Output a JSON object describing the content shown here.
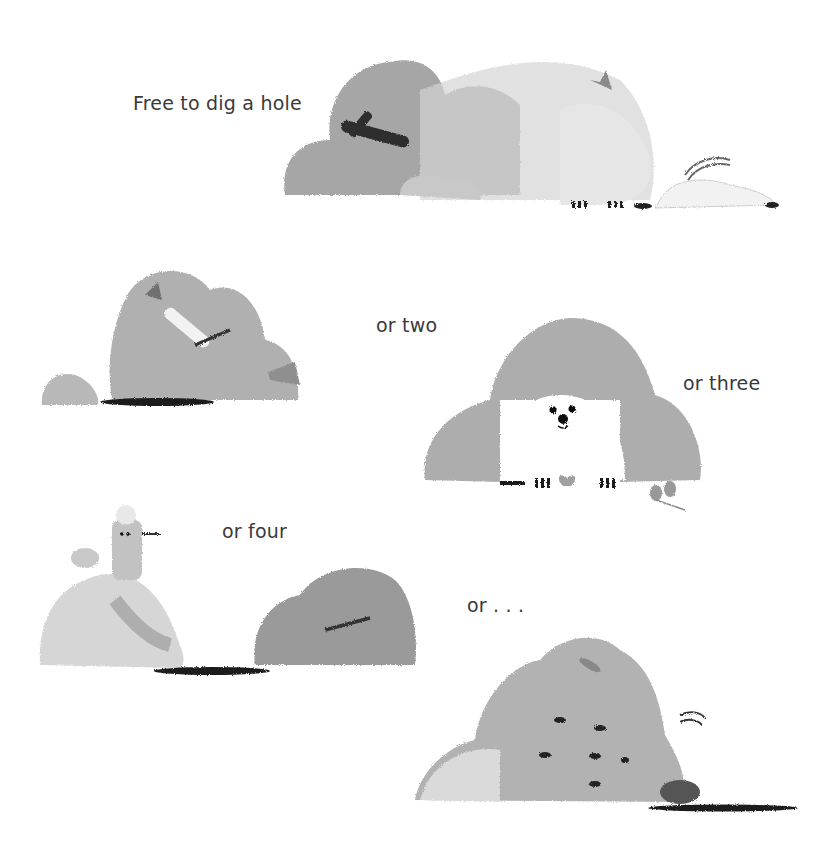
{
  "page": {
    "type": "illustrated picture-book page",
    "palette": {
      "mound_dark": "#8f8f8f",
      "mound_mid": "#a8a8a8",
      "mound_light": "#c4c4c4",
      "mound_pale": "#dcdcdc",
      "ink": "#222222",
      "text": "#3a3a3a"
    }
  },
  "captions": [
    {
      "id": "c1",
      "text": "Free to dig a hole"
    },
    {
      "id": "c2",
      "text": "or two"
    },
    {
      "id": "c3",
      "text": "or three"
    },
    {
      "id": "c4",
      "text": "or four"
    },
    {
      "id": "c5",
      "text": "or . . ."
    }
  ],
  "scenes": [
    {
      "id": "scene-1",
      "description": "large dirt mound with stick and leaves, dirt spraying from a digging animal with a bow, holes in ground"
    },
    {
      "id": "scene-2",
      "description": "small mound and medium mound with bone, fish and leaf, dark hole"
    },
    {
      "id": "scene-3",
      "description": "white fluffy animal peeking from under an arch of dirt, small sprout nearby"
    },
    {
      "id": "scene-4",
      "description": "pale mound with a bird on top, dark hole, grey mound with stick"
    },
    {
      "id": "scene-5",
      "description": "large mound with flying dirt clumps, animal digging at right, long hole"
    }
  ]
}
